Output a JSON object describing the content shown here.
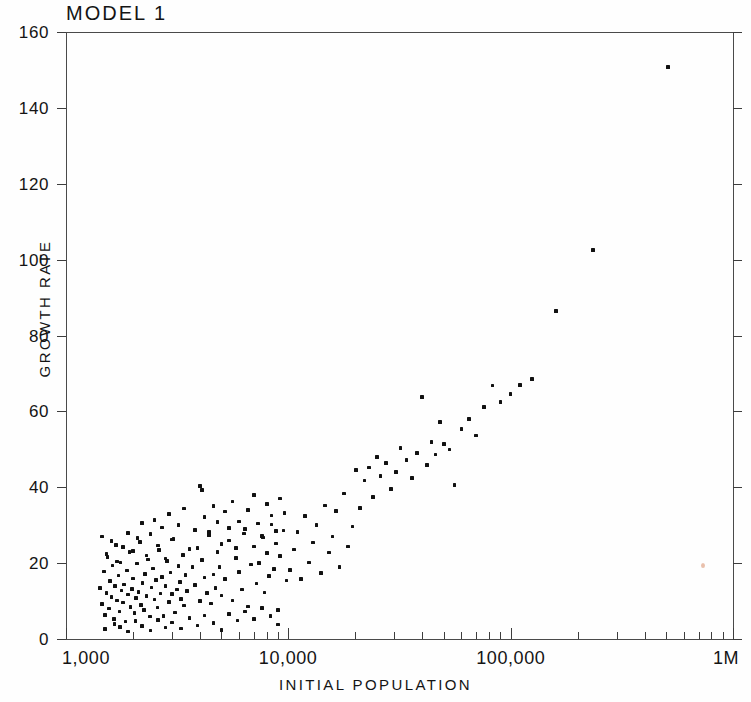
{
  "chart_data": {
    "type": "scatter",
    "title": "MODEL 1",
    "xlabel": "INITIAL  POPULATION",
    "ylabel": "GROWTH RATE",
    "xscale": "log",
    "yscale": "linear",
    "xlim": [
      1000,
      1000000
    ],
    "ylim": [
      0,
      160
    ],
    "grid": false,
    "legend": null,
    "x_tick_labels": [
      "1,000",
      "10,000",
      "100,000",
      "1M"
    ],
    "x_tick_values": [
      1000,
      10000,
      100000,
      1000000
    ],
    "y_tick_labels": [
      "0",
      "20",
      "40",
      "60",
      "80",
      "100",
      "120",
      "140",
      "160"
    ],
    "y_tick_values": [
      0,
      20,
      40,
      60,
      80,
      100,
      120,
      140,
      160
    ],
    "marker": "square",
    "marker_color": "#111111",
    "n_points": 251,
    "points": [
      [
        1420,
        13.5
      ],
      [
        1450,
        9.2
      ],
      [
        1480,
        17.8
      ],
      [
        1500,
        6.4
      ],
      [
        1520,
        12.1
      ],
      [
        1540,
        21.6
      ],
      [
        1560,
        8.0
      ],
      [
        1580,
        15.3
      ],
      [
        1600,
        11.0
      ],
      [
        1620,
        19.4
      ],
      [
        1640,
        5.2
      ],
      [
        1660,
        13.9
      ],
      [
        1680,
        24.8
      ],
      [
        1700,
        10.1
      ],
      [
        1720,
        16.7
      ],
      [
        1740,
        7.3
      ],
      [
        1760,
        20.2
      ],
      [
        1780,
        12.8
      ],
      [
        1800,
        9.6
      ],
      [
        1820,
        14.4
      ],
      [
        1850,
        4.6
      ],
      [
        1880,
        18.1
      ],
      [
        1900,
        11.7
      ],
      [
        1930,
        22.9
      ],
      [
        1950,
        8.5
      ],
      [
        1980,
        13.2
      ],
      [
        2000,
        16.0
      ],
      [
        2030,
        6.8
      ],
      [
        2060,
        10.8
      ],
      [
        2090,
        19.9
      ],
      [
        2120,
        12.4
      ],
      [
        2150,
        25.6
      ],
      [
        2180,
        9.0
      ],
      [
        2210,
        14.8
      ],
      [
        2240,
        7.7
      ],
      [
        2270,
        17.2
      ],
      [
        2300,
        11.3
      ],
      [
        2340,
        21.0
      ],
      [
        2380,
        5.9
      ],
      [
        2420,
        13.6
      ],
      [
        2460,
        18.6
      ],
      [
        2500,
        10.4
      ],
      [
        2540,
        15.6
      ],
      [
        2580,
        8.3
      ],
      [
        2620,
        23.4
      ],
      [
        2660,
        12.0
      ],
      [
        2700,
        16.4
      ],
      [
        2750,
        6.1
      ],
      [
        2800,
        14.0
      ],
      [
        2850,
        20.6
      ],
      [
        2900,
        9.8
      ],
      [
        2950,
        17.5
      ],
      [
        3000,
        11.9
      ],
      [
        3050,
        26.4
      ],
      [
        3100,
        7.0
      ],
      [
        3150,
        13.1
      ],
      [
        3200,
        19.2
      ],
      [
        3250,
        15.0
      ],
      [
        3300,
        10.6
      ],
      [
        3350,
        22.2
      ],
      [
        3400,
        8.8
      ],
      [
        3450,
        16.9
      ],
      [
        3500,
        12.6
      ],
      [
        3600,
        5.4
      ],
      [
        3700,
        18.9
      ],
      [
        3800,
        14.2
      ],
      [
        3900,
        24.0
      ],
      [
        4000,
        10.0
      ],
      [
        4100,
        20.8
      ],
      [
        4200,
        16.2
      ],
      [
        4300,
        12.2
      ],
      [
        4400,
        28.2
      ],
      [
        4500,
        9.4
      ],
      [
        4600,
        17.0
      ],
      [
        4700,
        13.4
      ],
      [
        4800,
        23.0
      ],
      [
        4900,
        19.0
      ],
      [
        5000,
        11.5
      ],
      [
        5200,
        15.8
      ],
      [
        5400,
        26.0
      ],
      [
        5600,
        10.2
      ],
      [
        5800,
        21.4
      ],
      [
        6000,
        17.6
      ],
      [
        6200,
        13.0
      ],
      [
        6400,
        29.0
      ],
      [
        6600,
        8.6
      ],
      [
        6800,
        19.6
      ],
      [
        7000,
        24.4
      ],
      [
        7200,
        14.6
      ],
      [
        7400,
        20.0
      ],
      [
        7600,
        27.2
      ],
      [
        7800,
        12.3
      ],
      [
        8000,
        22.6
      ],
      [
        8200,
        16.6
      ],
      [
        8400,
        30.2
      ],
      [
        8600,
        18.4
      ],
      [
        8800,
        25.2
      ],
      [
        9000,
        3.8
      ],
      [
        9200,
        21.8
      ],
      [
        9500,
        28.6
      ],
      [
        9800,
        15.4
      ],
      [
        1450,
        27.0
      ],
      [
        1520,
        22.4
      ],
      [
        1600,
        25.8
      ],
      [
        1700,
        20.4
      ],
      [
        1800,
        24.2
      ],
      [
        1900,
        28.0
      ],
      [
        2000,
        23.2
      ],
      [
        2100,
        26.6
      ],
      [
        2200,
        30.6
      ],
      [
        2300,
        22.0
      ],
      [
        2400,
        27.6
      ],
      [
        2500,
        31.4
      ],
      [
        2600,
        24.6
      ],
      [
        2700,
        29.4
      ],
      [
        2800,
        21.2
      ],
      [
        2900,
        33.0
      ],
      [
        3000,
        26.2
      ],
      [
        3200,
        30.0
      ],
      [
        3400,
        34.4
      ],
      [
        3600,
        23.8
      ],
      [
        3800,
        28.8
      ],
      [
        4000,
        40.4
      ],
      [
        4100,
        39.2
      ],
      [
        4200,
        32.2
      ],
      [
        4400,
        27.4
      ],
      [
        4600,
        35.0
      ],
      [
        4800,
        30.8
      ],
      [
        5000,
        25.0
      ],
      [
        5200,
        33.6
      ],
      [
        5400,
        29.2
      ],
      [
        5600,
        36.2
      ],
      [
        5800,
        24.0
      ],
      [
        6000,
        31.0
      ],
      [
        6300,
        27.8
      ],
      [
        6600,
        34.0
      ],
      [
        7000,
        38.0
      ],
      [
        7300,
        30.4
      ],
      [
        7700,
        26.8
      ],
      [
        8000,
        35.6
      ],
      [
        8400,
        32.6
      ],
      [
        8800,
        28.4
      ],
      [
        9200,
        37.0
      ],
      [
        9600,
        33.2
      ],
      [
        1500,
        2.6
      ],
      [
        1650,
        4.0
      ],
      [
        1750,
        3.2
      ],
      [
        1900,
        2.0
      ],
      [
        2050,
        4.8
      ],
      [
        2200,
        3.4
      ],
      [
        2400,
        2.2
      ],
      [
        2600,
        5.0
      ],
      [
        2800,
        3.0
      ],
      [
        3000,
        4.4
      ],
      [
        3300,
        2.8
      ],
      [
        3600,
        5.6
      ],
      [
        3900,
        3.6
      ],
      [
        4200,
        6.2
      ],
      [
        4600,
        4.2
      ],
      [
        5000,
        2.4
      ],
      [
        5400,
        6.6
      ],
      [
        5900,
        4.9
      ],
      [
        6400,
        7.2
      ],
      [
        7000,
        5.3
      ],
      [
        7600,
        8.2
      ],
      [
        8300,
        6.0
      ],
      [
        9000,
        7.6
      ],
      [
        10200,
        18.2
      ],
      [
        10600,
        23.6
      ],
      [
        11000,
        28.2
      ],
      [
        11400,
        15.8
      ],
      [
        11900,
        32.4
      ],
      [
        12400,
        20.2
      ],
      [
        12900,
        25.4
      ],
      [
        13400,
        30.0
      ],
      [
        14000,
        17.4
      ],
      [
        14600,
        35.2
      ],
      [
        15200,
        22.8
      ],
      [
        15800,
        27.0
      ],
      [
        16400,
        33.8
      ],
      [
        17000,
        19.0
      ],
      [
        17800,
        38.4
      ],
      [
        18600,
        24.4
      ],
      [
        19400,
        29.6
      ],
      [
        20200,
        44.6
      ],
      [
        21000,
        34.6
      ],
      [
        22000,
        41.8
      ],
      [
        23000,
        45.2
      ],
      [
        24000,
        37.4
      ],
      [
        25000,
        48.0
      ],
      [
        26000,
        43.0
      ],
      [
        27500,
        46.4
      ],
      [
        29000,
        39.6
      ],
      [
        30500,
        44.0
      ],
      [
        32000,
        50.4
      ],
      [
        34000,
        47.2
      ],
      [
        36000,
        42.4
      ],
      [
        38000,
        49.0
      ],
      [
        40000,
        63.8
      ],
      [
        42000,
        45.8
      ],
      [
        44000,
        52.0
      ],
      [
        46000,
        48.6
      ],
      [
        48000,
        57.2
      ],
      [
        50000,
        51.4
      ],
      [
        53000,
        50.0
      ],
      [
        56000,
        40.6
      ],
      [
        60000,
        55.4
      ],
      [
        65000,
        58.0
      ],
      [
        70000,
        53.6
      ],
      [
        76000,
        61.2
      ],
      [
        83000,
        66.8
      ],
      [
        90000,
        62.4
      ],
      [
        100000,
        64.6
      ],
      [
        110000,
        67.0
      ],
      [
        125000,
        68.6
      ],
      [
        160000,
        86.4
      ],
      [
        235000,
        102.6
      ],
      [
        510000,
        150.8
      ]
    ]
  },
  "figure": {
    "scan_artifact_label": "scan-speck"
  }
}
